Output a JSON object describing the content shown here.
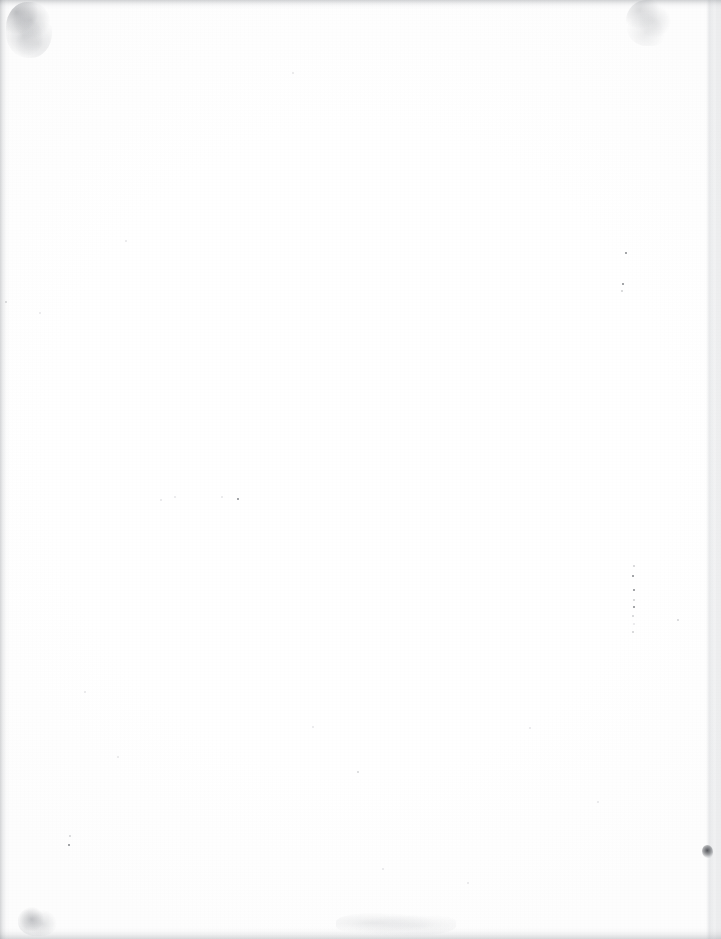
{
  "document": {
    "kind": "scanned-page",
    "page_content": "",
    "visible_text": "",
    "note": "blank page",
    "width_px": 721,
    "height_px": 939
  },
  "colors": {
    "paper": "#ffffff",
    "edge_shadow": "#7a7e86",
    "speck": "#3c3f46",
    "blot": "#282a30"
  },
  "artifacts": {
    "edges": [
      {
        "name": "top-edge-shadow"
      },
      {
        "name": "bottom-edge-shadow"
      },
      {
        "name": "left-edge-shadow"
      },
      {
        "name": "right-edge-shadow"
      },
      {
        "name": "right-platen-band"
      }
    ],
    "smudges": [
      {
        "name": "top-left-smudge",
        "x": 6,
        "y": 2,
        "w": 46,
        "h": 56
      },
      {
        "name": "top-right-smudge",
        "x": 626,
        "y": 0,
        "w": 46,
        "h": 46
      },
      {
        "name": "bottom-left-smudge",
        "x": 18,
        "y": 906,
        "w": 40,
        "h": 30
      },
      {
        "name": "bottom-center-smudge",
        "x": 336,
        "y": 912,
        "w": 120,
        "h": 24
      }
    ],
    "blots": [
      {
        "name": "right-edge-ink-blot",
        "x": 702,
        "y": 845,
        "w": 11,
        "h": 13
      }
    ],
    "specks": [
      {
        "x": 626,
        "y": 253,
        "s": 2.2,
        "c": "dark"
      },
      {
        "x": 623,
        "y": 284,
        "s": 2.0,
        "c": "dark"
      },
      {
        "x": 622,
        "y": 291,
        "s": 1.6,
        "c": "faint"
      },
      {
        "x": 634,
        "y": 566,
        "s": 1.4,
        "c": "faint"
      },
      {
        "x": 633,
        "y": 576,
        "s": 2.4,
        "c": "dark"
      },
      {
        "x": 634,
        "y": 590,
        "s": 2.0,
        "c": "dark"
      },
      {
        "x": 634,
        "y": 600,
        "s": 1.6,
        "c": "faint"
      },
      {
        "x": 634,
        "y": 607,
        "s": 2.0,
        "c": "dark"
      },
      {
        "x": 633,
        "y": 616,
        "s": 1.5,
        "c": "faint"
      },
      {
        "x": 634,
        "y": 624,
        "s": 1.4,
        "c": "vfaint"
      },
      {
        "x": 633,
        "y": 632,
        "s": 1.6,
        "c": "faint"
      },
      {
        "x": 678,
        "y": 620,
        "s": 1.8,
        "c": "faint"
      },
      {
        "x": 238,
        "y": 499,
        "s": 2.6,
        "c": "dark"
      },
      {
        "x": 175,
        "y": 497,
        "s": 1.6,
        "c": "vfaint"
      },
      {
        "x": 222,
        "y": 497,
        "s": 1.3,
        "c": "vfaint"
      },
      {
        "x": 161,
        "y": 500,
        "s": 1.3,
        "c": "vfaint"
      },
      {
        "x": 358,
        "y": 772,
        "s": 2.0,
        "c": "faint"
      },
      {
        "x": 70,
        "y": 836,
        "s": 1.8,
        "c": "faint"
      },
      {
        "x": 69,
        "y": 845,
        "s": 2.0,
        "c": "dark"
      },
      {
        "x": 118,
        "y": 757,
        "s": 1.5,
        "c": "vfaint"
      },
      {
        "x": 313,
        "y": 727,
        "s": 1.4,
        "c": "vfaint"
      },
      {
        "x": 530,
        "y": 728,
        "s": 1.6,
        "c": "vfaint"
      },
      {
        "x": 40,
        "y": 313,
        "s": 1.8,
        "c": "vfaint"
      },
      {
        "x": 6,
        "y": 302,
        "s": 2.0,
        "c": "faint"
      },
      {
        "x": 293,
        "y": 73,
        "s": 1.5,
        "c": "vfaint"
      },
      {
        "x": 126,
        "y": 241,
        "s": 1.3,
        "c": "vfaint"
      },
      {
        "x": 383,
        "y": 869,
        "s": 1.4,
        "c": "vfaint"
      },
      {
        "x": 468,
        "y": 883,
        "s": 1.3,
        "c": "vfaint"
      },
      {
        "x": 598,
        "y": 802,
        "s": 1.3,
        "c": "vfaint"
      },
      {
        "x": 85,
        "y": 692,
        "s": 1.3,
        "c": "vfaint"
      }
    ]
  }
}
